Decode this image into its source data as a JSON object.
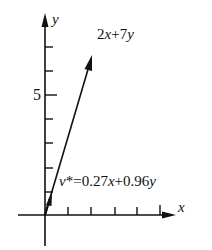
{
  "axes": {
    "x_label": "x",
    "y_label": "y",
    "y_tick_label": "5",
    "x_ticks": 5,
    "y_ticks": 7
  },
  "vectors": [
    {
      "name": "2x+7y",
      "label_main": "2",
      "label_x": "x",
      "label_plus": "+7",
      "label_y": "y",
      "components": [
        2,
        7
      ]
    },
    {
      "name": "v*",
      "label_v": "v",
      "label_star": "*=0.27",
      "label_x": "x",
      "label_plus": "+0.96",
      "label_y": "y",
      "components": [
        0.27,
        0.96
      ]
    }
  ],
  "colors": {
    "ink": "#111111",
    "background": "#ffffff"
  }
}
